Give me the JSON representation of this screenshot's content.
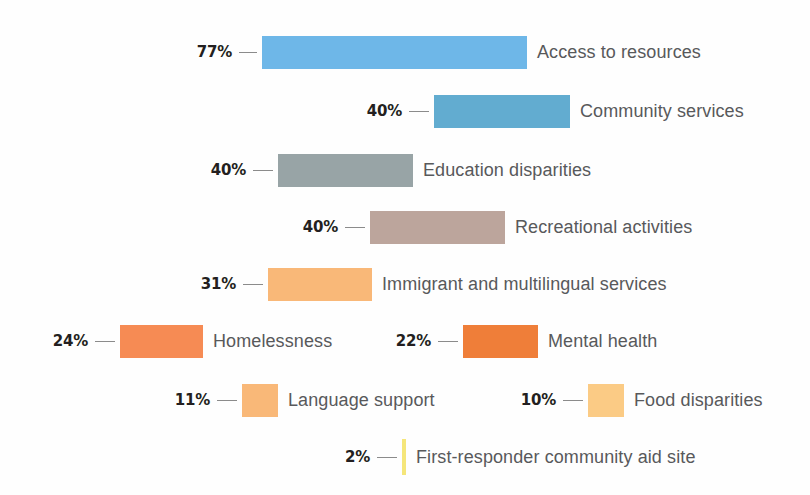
{
  "chart_data": {
    "type": "bar",
    "title": "",
    "subtitle": "",
    "xlabel": "",
    "ylabel": "",
    "orientation": "horizontal",
    "grid": false,
    "legend": "none",
    "value_suffix": "%",
    "categories": [
      "Access to resources",
      "Community services",
      "Education disparities",
      "Recreational activities",
      "Immigrant and multilingual services",
      "Homelessness",
      "Mental health",
      "Language support",
      "Food disparities",
      "First-responder community aid site"
    ],
    "values": [
      77,
      40,
      40,
      40,
      31,
      24,
      22,
      11,
      10,
      2
    ],
    "value_labels": [
      "77%",
      "40%",
      "40%",
      "40%",
      "31%",
      "24%",
      "22%",
      "11%",
      "10%",
      "2%"
    ],
    "colors": [
      "#6eb7e8",
      "#62acd0",
      "#98a4a6",
      "#bca59c",
      "#f9b878",
      "#f68b54",
      "#ef7e39",
      "#f9b878",
      "#fbcb85",
      "#f5e67a"
    ],
    "bars": [
      {
        "label": "Access to resources",
        "value_label": "77%",
        "value": 77,
        "color": "#6eb7e8",
        "left": 262,
        "width": 265,
        "top": 36,
        "leader": 18
      },
      {
        "label": "Community services",
        "value_label": "40%",
        "value": 40,
        "color": "#62acd0",
        "left": 434,
        "width": 136,
        "top": 95,
        "leader": 20
      },
      {
        "label": "Education disparities",
        "value_label": "40%",
        "value": 40,
        "color": "#98a4a6",
        "left": 278,
        "width": 135,
        "top": 154,
        "leader": 20
      },
      {
        "label": "Recreational activities",
        "value_label": "40%",
        "value": 40,
        "color": "#bca59c",
        "left": 370,
        "width": 135,
        "top": 211,
        "leader": 20
      },
      {
        "label": "Immigrant and multilingual services",
        "value_label": "31%",
        "value": 31,
        "color": "#f9b878",
        "left": 268,
        "width": 104,
        "top": 268,
        "leader": 20
      },
      {
        "label": "Homelessness",
        "value_label": "24%",
        "value": 24,
        "color": "#f68b54",
        "left": 120,
        "width": 83,
        "top": 325,
        "leader": 20
      },
      {
        "label": "Mental health",
        "value_label": "22%",
        "value": 22,
        "color": "#ef7e39",
        "left": 463,
        "width": 75,
        "top": 325,
        "leader": 20
      },
      {
        "label": "Language support",
        "value_label": "11%",
        "value": 11,
        "color": "#f9b878",
        "left": 242,
        "width": 36,
        "top": 384,
        "leader": 20
      },
      {
        "label": "Food disparities",
        "value_label": "10%",
        "value": 10,
        "color": "#fbcb85",
        "left": 588,
        "width": 36,
        "top": 384,
        "leader": 20
      },
      {
        "label": "First-responder community aid site",
        "value_label": "2%",
        "value": 2,
        "color": "#f5e67a",
        "left": 402,
        "width": 4,
        "top": 441,
        "leader": 20
      }
    ]
  },
  "background_color": "#fefefe",
  "text_color": "#58595b",
  "value_text_color": "#231f20"
}
